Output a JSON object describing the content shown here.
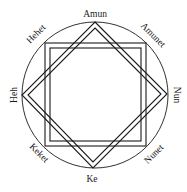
{
  "diagram": {
    "type": "ogdoad-octagram",
    "labels": {
      "top": "Amun",
      "top_right": "Amunet",
      "right": "Nun",
      "bottom_right": "Nunet",
      "bottom": "Ke",
      "bottom_left": "Keket",
      "left": "Heh",
      "top_left": "Hehet"
    },
    "colors": {
      "stroke": "#1a1a1a",
      "background": "#ffffff"
    }
  }
}
